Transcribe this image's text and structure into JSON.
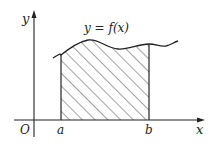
{
  "diagram": {
    "curve_label": "y = f(x)",
    "axes": {
      "x_label": "x",
      "y_label": "y",
      "origin_label": "O"
    },
    "bounds": {
      "a_label": "a",
      "b_label": "b"
    },
    "region": {
      "fill": "diagonal hatching",
      "description": "Shaded region bounded by curve, x-axis, x=a and x=b"
    },
    "colors": {
      "stroke": "#222222",
      "background": "#ffffff"
    }
  }
}
